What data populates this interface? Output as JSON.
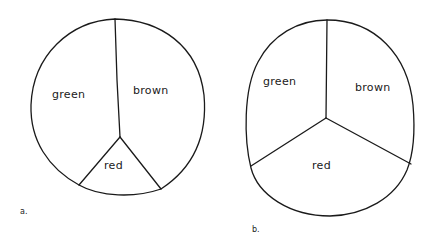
{
  "diagrams": [
    {
      "caption": "a.",
      "slices": [
        {
          "label": "green"
        },
        {
          "label": "brown"
        },
        {
          "label": "red"
        }
      ]
    },
    {
      "caption": "b.",
      "slices": [
        {
          "label": "green"
        },
        {
          "label": "brown"
        },
        {
          "label": "red"
        }
      ]
    }
  ],
  "colors": {
    "stroke": "#1a1a1a",
    "background": "#ffffff"
  }
}
